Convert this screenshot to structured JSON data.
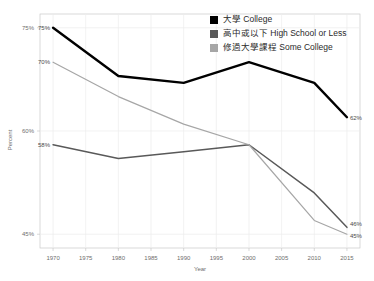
{
  "chart_data": {
    "type": "line",
    "title": "",
    "xlabel": "Year",
    "ylabel": "Percent",
    "x": [
      1970,
      1980,
      1990,
      2000,
      2010,
      2015
    ],
    "xticks": [
      "1970",
      "1975",
      "1980",
      "1985",
      "1990",
      "1995",
      "2000",
      "2005",
      "2010",
      "2015"
    ],
    "yticks": [
      "45%",
      "60%",
      "75%"
    ],
    "xlim": [
      1968,
      2017
    ],
    "ylim": [
      43,
      77
    ],
    "grid": true,
    "legend_position": "top-right",
    "series": [
      {
        "name": "大學 College",
        "color": "#000000",
        "values": [
          75,
          68,
          67,
          70,
          67,
          62
        ],
        "x": [
          1970,
          1980,
          1990,
          2000,
          2010,
          2015
        ],
        "start_label": "75%",
        "end_label": "62%"
      },
      {
        "name": "高中或以下 High School or Less",
        "color": "#595959",
        "values": [
          58,
          56,
          57,
          58,
          51,
          46
        ],
        "x": [
          1970,
          1980,
          1990,
          2000,
          2010,
          2015
        ],
        "start_label": "58%",
        "end_label": "46%"
      },
      {
        "name": "修過大學課程 Some College",
        "color": "#a6a6a6",
        "values": [
          70,
          65,
          61,
          58,
          47,
          45
        ],
        "x": [
          1970,
          1980,
          1990,
          2000,
          2010,
          2015
        ],
        "start_label": "70%",
        "end_label": "45%"
      }
    ]
  },
  "legend": {
    "items": [
      {
        "label": "大學 College",
        "color": "#000000"
      },
      {
        "label": "高中或以下 High School or Less",
        "color": "#595959"
      },
      {
        "label": "修過大學課程 Some College",
        "color": "#a6a6a6"
      }
    ]
  },
  "axes": {
    "x_title": "Year",
    "y_title": "Percent",
    "x_tick_labels": [
      "1970",
      "1975",
      "1980",
      "1985",
      "1990",
      "1995",
      "2000",
      "2005",
      "2010",
      "2015"
    ],
    "y_tick_labels": [
      "75%",
      "60%",
      "45%"
    ]
  },
  "data_labels": {
    "college_start": "75%",
    "college_end": "62%",
    "some_college_start": "70%",
    "some_college_end": "45%",
    "highschool_start": "58%",
    "highschool_end": "46%"
  }
}
